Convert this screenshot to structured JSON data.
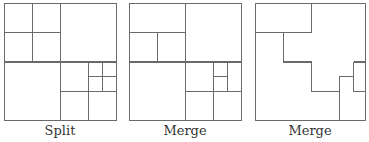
{
  "figure": {
    "panels": [
      {
        "id": "split",
        "label": "Split"
      },
      {
        "id": "merge-1",
        "label": "Merge"
      },
      {
        "id": "merge-2",
        "label": "Merge"
      }
    ]
  }
}
